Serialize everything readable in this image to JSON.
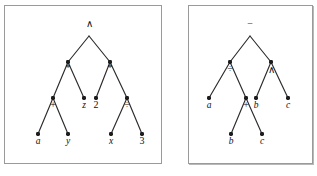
{
  "figure": {
    "panel_count": 2,
    "background_color": "#ffffff",
    "border_color": "#9a9a9a",
    "node_color": "#1c1c1c",
    "edge_color": "#2b2b2b"
  },
  "panels": [
    {
      "name": "left-expression-tree",
      "root_label": "∧",
      "nodes": [
        {
          "id": "L0",
          "label": "∧",
          "style": "op",
          "x": 84,
          "y": 26,
          "label_dx": 0,
          "label_dy": -5,
          "dot": false
        },
        {
          "id": "L1",
          "label": "*",
          "style": "op",
          "x": 63,
          "y": 56,
          "label_dx": 0,
          "label_dy": 9,
          "dot": true
        },
        {
          "id": "L2",
          "label": "*",
          "style": "op",
          "x": 105,
          "y": 56,
          "label_dx": 0,
          "label_dy": 9,
          "dot": true
        },
        {
          "id": "L3",
          "label": "+",
          "style": "op",
          "x": 48,
          "y": 92,
          "label_dx": 0,
          "label_dy": 10,
          "dot": true
        },
        {
          "id": "L4",
          "label": "z",
          "style": "italic",
          "x": 79,
          "y": 92,
          "label_dx": 0,
          "label_dy": 10,
          "dot": true
        },
        {
          "id": "L5",
          "label": "2",
          "style": "op",
          "x": 91,
          "y": 92,
          "label_dx": 0,
          "label_dy": 10,
          "dot": true
        },
        {
          "id": "L6",
          "label": "÷",
          "style": "op",
          "x": 122,
          "y": 92,
          "label_dx": 0,
          "label_dy": 10,
          "dot": true
        },
        {
          "id": "L7",
          "label": "a",
          "style": "italic",
          "x": 33,
          "y": 128,
          "label_dx": 0,
          "label_dy": 10,
          "dot": true
        },
        {
          "id": "L8",
          "label": "y",
          "style": "italic",
          "x": 63,
          "y": 128,
          "label_dx": 0,
          "label_dy": 10,
          "dot": true
        },
        {
          "id": "L9",
          "label": "x",
          "style": "italic",
          "x": 106,
          "y": 128,
          "label_dx": 0,
          "label_dy": 10,
          "dot": true
        },
        {
          "id": "L10",
          "label": "3",
          "style": "op",
          "x": 137,
          "y": 128,
          "label_dx": 0,
          "label_dy": 10,
          "dot": true
        }
      ],
      "edges": [
        [
          "L0",
          "L1"
        ],
        [
          "L0",
          "L2"
        ],
        [
          "L1",
          "L3"
        ],
        [
          "L1",
          "L4"
        ],
        [
          "L2",
          "L5"
        ],
        [
          "L2",
          "L6"
        ],
        [
          "L3",
          "L7"
        ],
        [
          "L3",
          "L8"
        ],
        [
          "L6",
          "L9"
        ],
        [
          "L6",
          "L10"
        ]
      ]
    },
    {
      "name": "right-expression-tree",
      "root_label": "−",
      "nodes": [
        {
          "id": "R0",
          "label": "−",
          "style": "op",
          "x": 61,
          "y": 26,
          "label_dx": 0,
          "label_dy": -5,
          "dot": false
        },
        {
          "id": "R1",
          "label": "÷",
          "style": "op",
          "x": 41,
          "y": 56,
          "label_dx": 0,
          "label_dy": 10,
          "dot": true
        },
        {
          "id": "R2",
          "label": "∧",
          "style": "op",
          "x": 82,
          "y": 56,
          "label_dx": 0,
          "label_dy": 11,
          "dot": true
        },
        {
          "id": "R3",
          "label": "a",
          "style": "italic",
          "x": 20,
          "y": 92,
          "label_dx": 0,
          "label_dy": 10,
          "dot": true
        },
        {
          "id": "R4",
          "label": "+",
          "style": "op",
          "x": 57,
          "y": 92,
          "label_dx": 0,
          "label_dy": 10,
          "dot": true
        },
        {
          "id": "R5",
          "label": "b",
          "style": "italic",
          "x": 67,
          "y": 92,
          "label_dx": 0,
          "label_dy": 10,
          "dot": true
        },
        {
          "id": "R6",
          "label": "c",
          "style": "italic",
          "x": 99,
          "y": 92,
          "label_dx": 0,
          "label_dy": 10,
          "dot": true
        },
        {
          "id": "R7",
          "label": "b",
          "style": "italic",
          "x": 42,
          "y": 128,
          "label_dx": 0,
          "label_dy": 10,
          "dot": true
        },
        {
          "id": "R8",
          "label": "c",
          "style": "italic",
          "x": 73,
          "y": 128,
          "label_dx": 0,
          "label_dy": 10,
          "dot": true
        }
      ],
      "edges": [
        [
          "R0",
          "R1"
        ],
        [
          "R0",
          "R2"
        ],
        [
          "R1",
          "R3"
        ],
        [
          "R1",
          "R4"
        ],
        [
          "R2",
          "R5"
        ],
        [
          "R2",
          "R6"
        ],
        [
          "R4",
          "R7"
        ],
        [
          "R4",
          "R8"
        ]
      ]
    }
  ]
}
